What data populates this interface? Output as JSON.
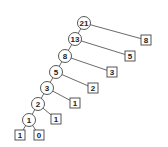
{
  "diagram": {
    "internal_nodes": [
      {
        "id": "n21",
        "label": "21",
        "x": 84,
        "y": 23
      },
      {
        "id": "n13",
        "label": "13",
        "x": 75,
        "y": 39
      },
      {
        "id": "n8",
        "label": "8",
        "x": 65,
        "y": 56
      },
      {
        "id": "n5",
        "label": "5",
        "x": 56,
        "y": 72
      },
      {
        "id": "n3",
        "label": "3",
        "x": 47,
        "y": 88
      },
      {
        "id": "n2",
        "label": "2",
        "x": 38,
        "y": 104
      },
      {
        "id": "n1",
        "label": "1",
        "x": 29,
        "y": 120
      }
    ],
    "leaf_nodes": [
      {
        "id": "l8",
        "label": "8",
        "x": 146,
        "y": 40
      },
      {
        "id": "l5",
        "label": "5",
        "x": 130,
        "y": 56
      },
      {
        "id": "l3",
        "label": "3",
        "x": 112,
        "y": 72
      },
      {
        "id": "l2",
        "label": "2",
        "x": 93,
        "y": 88
      },
      {
        "id": "l1a",
        "label": "1",
        "x": 75,
        "y": 103
      },
      {
        "id": "l1b",
        "label": "1",
        "x": 56,
        "y": 119
      },
      {
        "id": "l1c",
        "label": "1",
        "x": 20,
        "y": 135
      },
      {
        "id": "l0",
        "label": "0",
        "x": 39,
        "y": 135
      }
    ],
    "edges": [
      [
        "n21",
        "n13"
      ],
      [
        "n21",
        "l8"
      ],
      [
        "n13",
        "n8"
      ],
      [
        "n13",
        "l5"
      ],
      [
        "n8",
        "n5"
      ],
      [
        "n8",
        "l3"
      ],
      [
        "n5",
        "n3"
      ],
      [
        "n5",
        "l2"
      ],
      [
        "n3",
        "n2"
      ],
      [
        "n3",
        "l1a"
      ],
      [
        "n2",
        "n1"
      ],
      [
        "n2",
        "l1b"
      ],
      [
        "n1",
        "l1c"
      ],
      [
        "n1",
        "l0"
      ]
    ],
    "circle_radius": 6.5,
    "box_size": 10,
    "stroke_color": "#444444",
    "fill_color": "#ffffff"
  }
}
